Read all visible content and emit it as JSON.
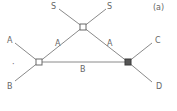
{
  "diagram": {
    "panel_label": "(a)",
    "nodes": [
      {
        "id": "top",
        "x": 83,
        "y": 27,
        "style": "open"
      },
      {
        "id": "left",
        "x": 39,
        "y": 62,
        "style": "open"
      },
      {
        "id": "right",
        "x": 128,
        "y": 62,
        "style": "filled"
      }
    ],
    "edges": [
      {
        "from": "left",
        "to": "top",
        "label": "A"
      },
      {
        "from": "top",
        "to": "right",
        "label": "A"
      },
      {
        "from": "left",
        "to": "right",
        "label": "B"
      }
    ],
    "external_legs": [
      {
        "node": "top",
        "label": "S",
        "direction": "up-left"
      },
      {
        "node": "top",
        "label": "S",
        "direction": "up-right"
      },
      {
        "node": "left",
        "label": "A",
        "direction": "up-left"
      },
      {
        "node": "left",
        "label": "B",
        "direction": "down-left"
      },
      {
        "node": "right",
        "label": "C",
        "direction": "up-right"
      },
      {
        "node": "right",
        "label": "D",
        "direction": "down-right"
      }
    ],
    "labels": {
      "s_left": "S",
      "s_right": "S",
      "ext_a": "A",
      "ext_b": "B",
      "ext_c": "C",
      "ext_d": "D",
      "edge_left_a": "A",
      "edge_right_a": "A",
      "edge_bottom_b": "B",
      "dot": "·"
    },
    "colors": {
      "line": "#8a8a8a",
      "text": "#666666",
      "filled_node": "#555555"
    }
  }
}
